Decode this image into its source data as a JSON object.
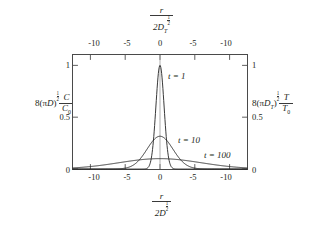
{
  "figure": {
    "axes": {
      "top": {
        "label": {
          "numerator": "r",
          "denominator_prefix": "2D",
          "denominator_sub": "T",
          "denominator_exp_num": "1",
          "denominator_exp_den": "2"
        },
        "ticks": [
          "-10",
          "-5",
          "0",
          "-5",
          "-10"
        ],
        "tick_positions": [
          -10,
          -5,
          0,
          5,
          10
        ]
      },
      "bottom": {
        "label": {
          "numerator": "r",
          "denominator_prefix": "2D",
          "denominator_sub": "",
          "denominator_exp_num": "1",
          "denominator_exp_den": "2"
        },
        "ticks": [
          "-10",
          "-5",
          "0",
          "-5",
          "-10"
        ],
        "tick_positions": [
          -10,
          -5,
          0,
          5,
          10
        ]
      },
      "left": {
        "label": {
          "coefficient": "8(",
          "pi": "π",
          "symbol": "D",
          "sub": "",
          "close": ")",
          "exp_num": "1",
          "exp_den": "2",
          "frac_num": "C",
          "frac_den": "C",
          "frac_den_sub": "0"
        },
        "ticks": [
          "0",
          "0.5",
          "1"
        ],
        "tick_positions": [
          0,
          0.5,
          1
        ]
      },
      "right": {
        "label": {
          "coefficient": "8(",
          "pi": "π",
          "symbol": "D",
          "sub": "T",
          "close": ")",
          "exp_num": "1",
          "exp_den": "2",
          "frac_num": "T",
          "frac_den": "T",
          "frac_den_sub": "0"
        },
        "ticks": [
          "0",
          "0.5",
          "1"
        ],
        "tick_positions": [
          0,
          0.5,
          1
        ]
      }
    },
    "annotations": [
      {
        "id": "t1",
        "text": "t = 1",
        "x_px": 168,
        "y_px": 72
      },
      {
        "id": "t10",
        "text": "t = 10",
        "x_px": 178,
        "y_px": 136
      },
      {
        "id": "t100",
        "text": "t = 100",
        "x_px": 204,
        "y_px": 151
      }
    ]
  },
  "chart_data": {
    "type": "line",
    "title": "",
    "xlabel": "r / (2D^(1/2))",
    "ylabel": "8(piD)^(1/2) C/C0",
    "xlim": [
      -12.5,
      12.5
    ],
    "ylim": [
      0,
      1.1
    ],
    "grid": false,
    "legend": "inline-annotations",
    "x_ticks": [
      -10,
      -5,
      0,
      5,
      10
    ],
    "x_tick_labels": [
      "-10",
      "-5",
      "0",
      "-5",
      "-10"
    ],
    "y_ticks": [
      0,
      0.5,
      1
    ],
    "y_tick_labels": [
      "0",
      "0.5",
      "1"
    ],
    "series": [
      {
        "name": "t = 1",
        "t": 1,
        "peak": 1.0,
        "half_width": 0.83,
        "x": [
          -12.5,
          -4,
          -3,
          -2.5,
          -2,
          -1.5,
          -1.2,
          -1,
          -0.8,
          -0.6,
          -0.4,
          -0.2,
          0,
          0.2,
          0.4,
          0.6,
          0.8,
          1,
          1.2,
          1.5,
          2,
          2.5,
          3,
          4,
          12.5
        ],
        "y": [
          0,
          0,
          0.0001,
          0.0019,
          0.0183,
          0.1054,
          0.2369,
          0.3679,
          0.5273,
          0.6977,
          0.8521,
          0.9608,
          1.0,
          0.9608,
          0.8521,
          0.6977,
          0.5273,
          0.3679,
          0.2369,
          0.1054,
          0.0183,
          0.0019,
          0.0001,
          0,
          0
        ]
      },
      {
        "name": "t = 10",
        "t": 10,
        "peak": 0.316,
        "half_width": 2.63,
        "x": [
          -12.5,
          -10,
          -8,
          -7,
          -6,
          -5,
          -4,
          -3,
          -2,
          -1,
          0,
          1,
          2,
          3,
          4,
          5,
          6,
          7,
          8,
          10,
          12.5
        ],
        "y": [
          0.0005,
          0.0032,
          0.0167,
          0.0308,
          0.0503,
          0.073,
          0.0951,
          0.1125,
          0.1235,
          0.1285,
          0.3162,
          0.1285,
          0.1235,
          0.1125,
          0.0951,
          0.073,
          0.0503,
          0.0308,
          0.0167,
          0.0032,
          0.0005
        ]
      },
      {
        "name": "t = 100",
        "t": 100,
        "peak": 0.1,
        "half_width": 8.33,
        "x": [
          -12.5,
          -10,
          -8,
          -6,
          -4,
          -2,
          0,
          2,
          4,
          6,
          8,
          10,
          12.5
        ],
        "y": [
          0.0211,
          0.0368,
          0.0527,
          0.0698,
          0.0852,
          0.0961,
          0.1,
          0.0961,
          0.0852,
          0.0698,
          0.0527,
          0.0368,
          0.0211
        ]
      }
    ]
  }
}
